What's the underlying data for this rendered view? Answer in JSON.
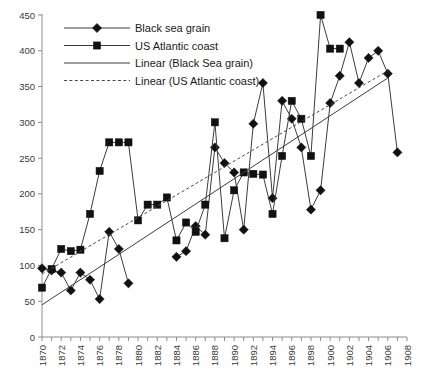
{
  "chart_data": {
    "type": "line",
    "title": "",
    "xlabel": "",
    "ylabel": "",
    "xlim": [
      1870,
      1908
    ],
    "ylim": [
      0,
      450
    ],
    "grid": false,
    "legend_position": "top-left",
    "x_tick_labels": [
      "1870",
      "1872",
      "1874",
      "1876",
      "1878",
      "1880",
      "1882",
      "1884",
      "1886",
      "1888",
      "1890",
      "1892",
      "1894",
      "1896",
      "1898",
      "1900",
      "1902",
      "1904",
      "1906",
      "1908"
    ],
    "x_tick_values": [
      1870,
      1872,
      1874,
      1876,
      1878,
      1880,
      1882,
      1884,
      1886,
      1888,
      1890,
      1892,
      1894,
      1896,
      1898,
      1900,
      1902,
      1904,
      1906,
      1908
    ],
    "x_minor_tick_values": [
      1871,
      1873,
      1875,
      1877,
      1879,
      1881,
      1883,
      1885,
      1887,
      1889,
      1891,
      1893,
      1895,
      1897,
      1899,
      1901,
      1903,
      1905,
      1907
    ],
    "y_tick_labels": [
      "0",
      "50",
      "100",
      "150",
      "200",
      "250",
      "300",
      "350",
      "400",
      "450"
    ],
    "y_tick_values": [
      0,
      50,
      100,
      150,
      200,
      250,
      300,
      350,
      400,
      450
    ],
    "series": [
      {
        "name": "Black sea grain",
        "marker": "diamond",
        "style": "solid",
        "x": [
          1870,
          1871,
          1872,
          1873,
          1874,
          1875,
          1876,
          1877,
          1878,
          1879,
          1880,
          1881,
          1882,
          1883,
          1884,
          1885,
          1886,
          1887,
          1888,
          1889,
          1890,
          1891,
          1892,
          1893,
          1894,
          1895,
          1896,
          1897,
          1898,
          1899,
          1900,
          1901,
          1902,
          1903,
          1904,
          1905,
          1906,
          1907,
          1908
        ],
        "values": [
          96,
          93,
          90,
          65,
          90,
          80,
          53,
          147,
          123,
          75,
          null,
          null,
          null,
          null,
          112,
          120,
          155,
          143,
          265,
          243,
          230,
          150,
          298,
          355,
          194,
          330,
          305,
          265,
          178,
          205,
          327,
          365,
          412,
          355,
          390,
          400,
          368,
          258,
          null
        ],
        "values_note": "marker values read off y-axis; null = no marker plotted at that year"
      },
      {
        "name": "US Atlantic coast",
        "marker": "square",
        "style": "solid",
        "x": [
          1870,
          1871,
          1872,
          1873,
          1874,
          1875,
          1876,
          1877,
          1878,
          1879,
          1880,
          1881,
          1882,
          1883,
          1884,
          1885,
          1886,
          1887,
          1888,
          1889,
          1890,
          1891,
          1892,
          1893,
          1894,
          1895,
          1896,
          1897,
          1898,
          1899,
          1900,
          1901
        ],
        "values": [
          69,
          95,
          123,
          120,
          122,
          172,
          232,
          272,
          272,
          272,
          163,
          185,
          185,
          195,
          135,
          160,
          147,
          185,
          300,
          138,
          205,
          230,
          228,
          227,
          172,
          253,
          330,
          305,
          253,
          450,
          403,
          403
        ],
        "values_note": "marker values read off y-axis; series ends at 1901"
      }
    ],
    "trendlines": [
      {
        "name": "Linear (Black Sea grain)",
        "style": "solid",
        "x0": 1870,
        "y0": 45,
        "x1": 1906,
        "y1": 362
      },
      {
        "name": "Linear (US Atlantic coast)",
        "style": "dashed",
        "x0": 1870,
        "y0": 88,
        "x1": 1906,
        "y1": 372
      }
    ],
    "legend": [
      {
        "label": "Black sea grain",
        "marker": "diamond",
        "line": "solid"
      },
      {
        "label": "US Atlantic coast",
        "marker": "square",
        "line": "solid"
      },
      {
        "label": "Linear (Black Sea grain)",
        "marker": "none",
        "line": "solid"
      },
      {
        "label": "Linear (US Atlantic coast)",
        "marker": "none",
        "line": "dashed"
      }
    ]
  }
}
